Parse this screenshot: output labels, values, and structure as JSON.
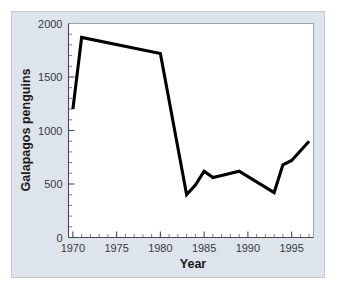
{
  "figure": {
    "panel_background": "#dde4ec",
    "plot_background": "#ffffff",
    "line_color": "#000000"
  },
  "chart_data": {
    "type": "line",
    "title": "",
    "xlabel": "Year",
    "ylabel": "Galapagos penguins",
    "xlim": [
      1969.5,
      1997.5
    ],
    "ylim": [
      0,
      2000
    ],
    "grid": false,
    "legend": "none",
    "x_ticks_major": [
      1970,
      1975,
      1980,
      1985,
      1990,
      1995
    ],
    "x_tick_labels": [
      "1970",
      "1975",
      "1980",
      "1985",
      "1990",
      "1995"
    ],
    "x_minor_tick_step": 1,
    "y_ticks_major": [
      0,
      500,
      1000,
      1500,
      2000
    ],
    "y_tick_labels": [
      "0",
      "500",
      "1000",
      "1500",
      "2000"
    ],
    "y_minor_tick_step": 100,
    "series": [
      {
        "name": "Galapagos penguins",
        "color": "#000000",
        "x": [
          1970,
          1971,
          1980,
          1983,
          1984,
          1985,
          1986,
          1987,
          1989,
          1993,
          1994,
          1995,
          1997
        ],
        "values": [
          1200,
          1870,
          1720,
          400,
          490,
          620,
          560,
          580,
          620,
          420,
          680,
          720,
          900
        ]
      }
    ]
  }
}
